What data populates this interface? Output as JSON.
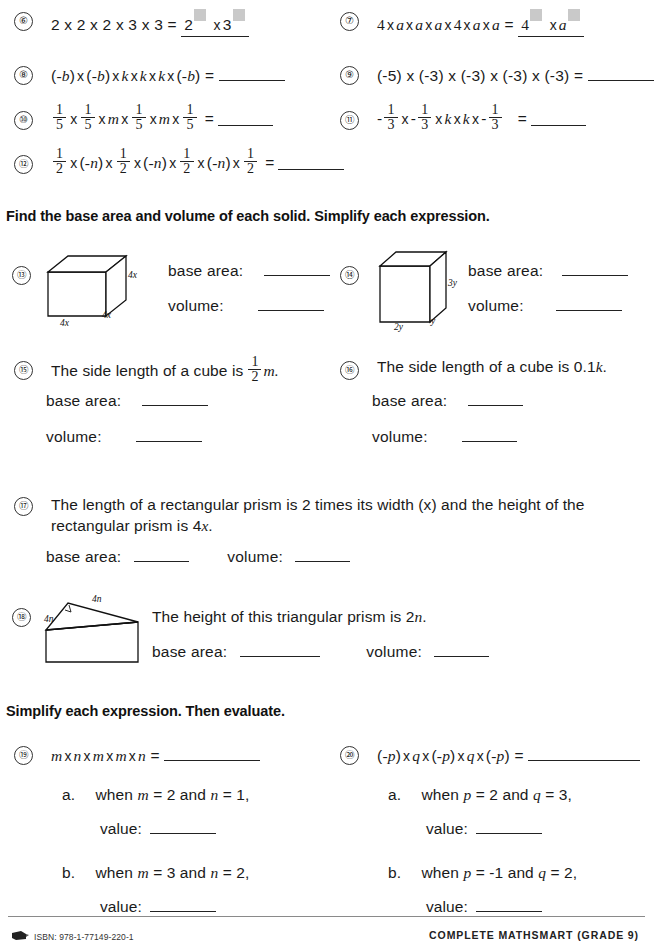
{
  "page": {
    "width": 653,
    "height": 952
  },
  "sections": {
    "solids_heading": "Find the base area and volume of each solid.  Simplify each expression.",
    "simplify_heading": "Simplify each expression.  Then evaluate."
  },
  "labels": {
    "base_area": "base area:",
    "volume": "volume:",
    "value": "value:",
    "equals": "=",
    "times": "x",
    "a_letter": "a.",
    "b_letter": "b."
  },
  "items": {
    "q6": {
      "number": "⑥",
      "expression": "2 x 2 x 2 x 3 x 3 =",
      "answer_base_1": "2",
      "answer_mult": "x",
      "answer_base_2": "3"
    },
    "q7": {
      "number": "⑦",
      "expression_parts": [
        "4",
        "x",
        "a",
        "x",
        "a",
        "x",
        "a",
        "x",
        "4",
        "x",
        "a",
        "x",
        "a",
        "="
      ],
      "expression_plain": "4 x a x a x a x 4 x a x a =",
      "answer_base_1": "4",
      "answer_mult": "x",
      "answer_base_2": "a"
    },
    "q8": {
      "number": "⑧",
      "expression_plain": "(-b) x (-b) x k x k x k x (-b) =",
      "tokens": [
        "(-b)",
        "x",
        "(-b)",
        "x",
        "k",
        "x",
        "k",
        "x",
        "k",
        "x",
        "(-b)",
        "="
      ]
    },
    "q9": {
      "number": "⑨",
      "expression_plain": "(-5) x (-3) x (-3) x (-3) x (-3) =",
      "tokens": [
        "(-5)",
        "x",
        "(-3)",
        "x",
        "(-3)",
        "x",
        "(-3)",
        "x",
        "(-3)",
        "="
      ]
    },
    "q10": {
      "number": "⑩",
      "fraction": {
        "numerator": "1",
        "denominator": "5"
      },
      "variable": "m",
      "expression_plain": "1/5 x 1/5 x m x 1/5 x m x 1/5 ="
    },
    "q11": {
      "number": "⑪",
      "fraction": {
        "numerator": "1",
        "denominator": "3"
      },
      "sign": "-",
      "variable": "k",
      "expression_plain": "-1/3 x -1/3 x k x k x -1/3 ="
    },
    "q12": {
      "number": "⑫",
      "fraction": {
        "numerator": "1",
        "denominator": "2"
      },
      "variable": "(-n)",
      "expression_plain": "1/2 x (-n) x 1/2 x (-n) x 1/2 x (-n) x 1/2 ="
    },
    "q13": {
      "number": "⑬",
      "shape": "cube",
      "edge_labels": [
        "4x",
        "4x",
        "4x"
      ],
      "label_bottom_front": "4x",
      "label_bottom_right": "4x",
      "label_side_right": "4x"
    },
    "q14": {
      "number": "⑭",
      "shape": "rectangular-prism",
      "label_bottom_front": "2y",
      "label_bottom_right": "y",
      "label_side_right": "3y"
    },
    "q15": {
      "number": "⑮",
      "text_before": "The side length of a cube is",
      "fraction": {
        "numerator": "1",
        "denominator": "2"
      },
      "text_after": "m.",
      "text_plain": "The side length of a cube is 1/2 m."
    },
    "q16": {
      "number": "⑯",
      "text_plain": "The side length of a cube is 0.1k.",
      "text_before": "The side length of a cube is 0.1",
      "variable": "k",
      "text_after": "."
    },
    "q17": {
      "number": "⑰",
      "line1": "The length of a rectangular prism is 2 times its width (x) and the height of the",
      "line2_before": "rectangular prism is 4",
      "line2_var": "x",
      "line2_after": ".",
      "line2_plain": "rectangular prism is 4x."
    },
    "q18": {
      "number": "⑱",
      "shape": "triangular-prism",
      "label_left": "4n",
      "label_right": "4n",
      "text_before": "The height of this triangular prism is 2",
      "text_var": "n",
      "text_after": ".",
      "text_plain": "The height of this triangular prism is 2n."
    },
    "q19": {
      "number": "⑲",
      "expression_plain": "m x n x m x m x n =",
      "tokens": [
        "m",
        "x",
        "n",
        "x",
        "m",
        "x",
        "m",
        "x",
        "n",
        "="
      ],
      "sub_a": {
        "marker": "a.",
        "condition_plain": "when m = 2 and n = 1,",
        "var1": "m",
        "val1": "2",
        "var2": "n",
        "val2": "1"
      },
      "sub_b": {
        "marker": "b.",
        "condition_plain": "when m = 3 and n = 2,",
        "var1": "m",
        "val1": "3",
        "var2": "n",
        "val2": "2"
      }
    },
    "q20": {
      "number": "⑳",
      "expression_plain": "(-p) x q x (-p) x q x (-p) =",
      "tokens": [
        "(-p)",
        "x",
        "q",
        "x",
        "(-p)",
        "x",
        "q",
        "x",
        "(-p)",
        "="
      ],
      "sub_a": {
        "marker": "a.",
        "condition_plain": "when p = 2 and q = 3,",
        "var1": "p",
        "val1": "2",
        "var2": "q",
        "val2": "3"
      },
      "sub_b": {
        "marker": "b.",
        "condition_plain": "when p = -1 and q = 2,",
        "var1": "p",
        "val1": "-1",
        "var2": "q",
        "val2": "2"
      }
    }
  },
  "footer": {
    "isbn": "ISBN: 978-1-77149-220-1",
    "brand": "COMPLETE MATHSMART (GRADE 9)"
  },
  "colors": {
    "ink": "#1a1a1a",
    "rule": "#222222",
    "placeholder_box": "#c9c9c9",
    "footer_rule": "#8a8a8a"
  }
}
